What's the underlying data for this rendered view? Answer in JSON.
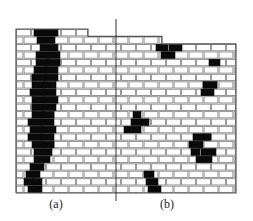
{
  "figure": {
    "panels": [
      {
        "label": "(a)",
        "label_x": 56,
        "label_y": 197,
        "pattern": "continuous diagonal crack band"
      },
      {
        "label": "(b)",
        "label_x": 167,
        "label_y": 197,
        "pattern": "scattered crack clusters"
      }
    ],
    "colors": {
      "mortar": "#8a8a8a",
      "brick": "#ffffff",
      "cracked_brick": "#0a0a0a",
      "divider": "#333333"
    },
    "wall": {
      "left": 16,
      "right": 236,
      "top": 29,
      "bottom": 193,
      "rows": 22,
      "top_steps": [
        {
          "row": 0,
          "right": 88
        },
        {
          "row": 1,
          "right": 162
        }
      ],
      "brick_length": 15
    },
    "divider": {
      "x": 116,
      "y1": 19,
      "y2": 201
    },
    "black_bricks": [
      [
        0,
        34,
        46
      ],
      [
        0,
        46,
        58
      ],
      [
        1,
        37,
        55
      ],
      [
        2,
        40,
        58
      ],
      [
        3,
        36,
        48
      ],
      [
        3,
        48,
        60
      ],
      [
        4,
        36,
        48
      ],
      [
        4,
        48,
        60
      ],
      [
        5,
        34,
        46
      ],
      [
        5,
        46,
        58
      ],
      [
        6,
        32,
        45
      ],
      [
        6,
        45,
        58
      ],
      [
        7,
        32,
        44
      ],
      [
        7,
        44,
        56
      ],
      [
        8,
        30,
        43
      ],
      [
        8,
        43,
        56
      ],
      [
        9,
        32,
        45
      ],
      [
        9,
        45,
        58
      ],
      [
        10,
        32,
        44
      ],
      [
        10,
        44,
        56
      ],
      [
        11,
        32,
        43
      ],
      [
        11,
        43,
        54
      ],
      [
        12,
        28,
        41
      ],
      [
        12,
        41,
        54
      ],
      [
        13,
        30,
        43
      ],
      [
        13,
        43,
        56
      ],
      [
        14,
        28,
        41
      ],
      [
        14,
        41,
        54
      ],
      [
        15,
        32,
        43
      ],
      [
        15,
        43,
        54
      ],
      [
        16,
        34,
        52
      ],
      [
        17,
        34,
        50
      ],
      [
        18,
        30,
        44
      ],
      [
        19,
        26,
        40
      ],
      [
        20,
        24,
        33
      ],
      [
        20,
        33,
        42
      ],
      [
        21,
        28,
        42
      ],
      [
        2,
        156,
        168
      ],
      [
        2,
        169,
        182
      ],
      [
        3,
        161,
        175
      ],
      [
        4,
        209,
        220
      ],
      [
        7,
        203,
        217
      ],
      [
        8,
        201,
        214
      ],
      [
        11,
        133,
        141
      ],
      [
        12,
        131,
        149
      ],
      [
        13,
        124,
        141
      ],
      [
        14,
        193,
        211
      ],
      [
        15,
        189,
        203
      ],
      [
        16,
        191,
        200
      ],
      [
        16,
        201,
        216
      ],
      [
        17,
        196,
        212
      ],
      [
        19,
        144,
        154
      ],
      [
        20,
        146,
        158
      ],
      [
        21,
        148,
        161
      ]
    ]
  }
}
